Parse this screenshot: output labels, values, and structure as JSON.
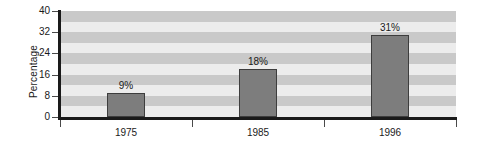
{
  "chart_data": {
    "type": "bar",
    "title": "",
    "xlabel": "",
    "ylabel": "Percentage",
    "categories": [
      "1975",
      "1985",
      "1996"
    ],
    "values": [
      9,
      18,
      31
    ],
    "value_labels": [
      "9%",
      "18%",
      "31%"
    ],
    "ylim": [
      0,
      40
    ],
    "yticks": [
      0,
      8,
      16,
      24,
      32,
      40
    ],
    "ytick_labels": [
      "0",
      "8",
      "16",
      "24",
      "32",
      "40"
    ],
    "grid": "horizontal-alternating-bands",
    "legend": null,
    "series": [
      {
        "name": "Percentage",
        "values": [
          9,
          18,
          31
        ]
      }
    ],
    "colors": {
      "bar_fill": "#7d7d7d",
      "bar_edge": "#3d3d3d",
      "band_light": "#ececec",
      "band_dark": "#c9c9c9",
      "axis": "#1a1a1a",
      "text": "#1a1a1a",
      "background": "#ffffff"
    }
  }
}
